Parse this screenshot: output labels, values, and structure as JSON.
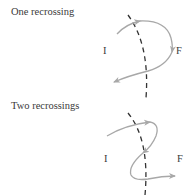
{
  "panels": [
    {
      "title": "One recrossing",
      "initial_label": "I",
      "final_label": "F",
      "recrossings": 1
    },
    {
      "title": "Two recrossings",
      "initial_label": "I",
      "final_label": "F",
      "recrossings": 2
    }
  ],
  "colors": {
    "trajectory": "#a8a8a8",
    "dividing_surface": "#333333",
    "text": "#3a3a3a"
  }
}
